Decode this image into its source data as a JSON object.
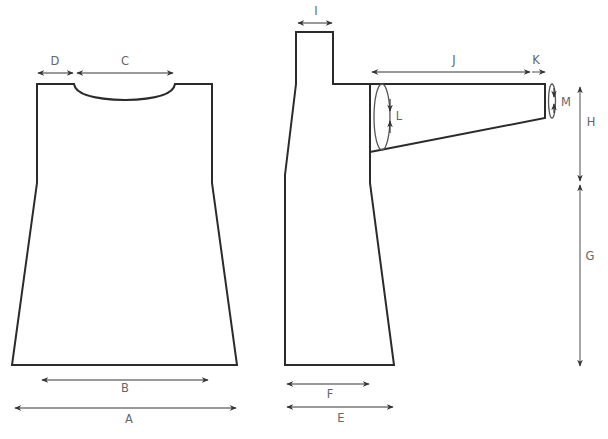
{
  "colors": {
    "outline": "#2b2b2b",
    "dimension_line": "#777777",
    "label": "#666666",
    "background": "#ffffff"
  },
  "pieces": {
    "front_body": {
      "name": "Front/Back body"
    },
    "side_view": {
      "name": "Side view with collar"
    },
    "sleeve": {
      "name": "Sleeve"
    }
  },
  "measurements": {
    "A": {
      "label": "A",
      "description": "Hem width (full)"
    },
    "B": {
      "label": "B",
      "description": "Width at bottom inner"
    },
    "C": {
      "label": "C",
      "description": "Neck width"
    },
    "D": {
      "label": "D",
      "description": "Shoulder width"
    },
    "E": {
      "label": "E",
      "description": "Side hem depth"
    },
    "F": {
      "label": "F",
      "description": "Side depth"
    },
    "G": {
      "label": "G",
      "description": "Body length to armhole"
    },
    "H": {
      "label": "H",
      "description": "Armhole depth"
    },
    "I": {
      "label": "I",
      "description": "Collar width"
    },
    "J": {
      "label": "J",
      "description": "Sleeve length"
    },
    "K": {
      "label": "K",
      "description": "Cuff"
    },
    "L": {
      "label": "L",
      "description": "Upper arm circumference"
    },
    "M": {
      "label": "M",
      "description": "Wrist circumference"
    }
  }
}
